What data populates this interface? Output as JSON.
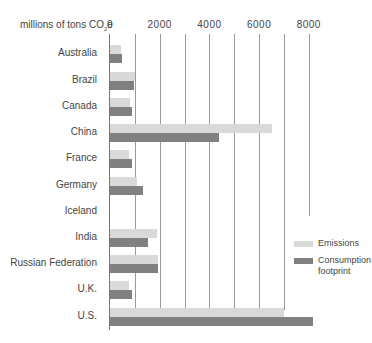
{
  "chart_data": {
    "type": "bar",
    "orientation": "horizontal",
    "title": "",
    "xlabel": "millions of tons CO2e",
    "ylabel": "",
    "xlim": [
      0,
      8000
    ],
    "xticks": [
      0,
      2000,
      4000,
      6000,
      8000
    ],
    "grid": true,
    "gridline_interval": 1000,
    "legend_position": "right",
    "categories": [
      "Australia",
      "Brazil",
      "Canada",
      "China",
      "France",
      "Germany",
      "Iceland",
      "India",
      "Russian Federation",
      "U.K.",
      "U.S."
    ],
    "series": [
      {
        "name": "Emissions",
        "color": "#d9d9d9",
        "values": [
          440,
          1000,
          800,
          6500,
          770,
          1080,
          5,
          1890,
          1940,
          760,
          7000
        ]
      },
      {
        "name": "Consumption footprint",
        "color": "#808080",
        "values": [
          480,
          970,
          880,
          4400,
          880,
          1330,
          5,
          1530,
          1940,
          870,
          8150
        ]
      }
    ]
  },
  "axis": {
    "unit_prefix": "millions of tons CO",
    "unit_sub": "2",
    "unit_suffix": "e",
    "ticks": [
      "0",
      "2000",
      "4000",
      "6000",
      "8000"
    ]
  },
  "legend": {
    "emissions": "Emissions",
    "consumption": "Consumption footprint"
  }
}
